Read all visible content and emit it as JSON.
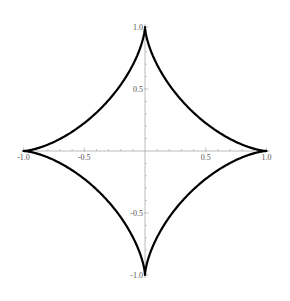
{
  "chart_data": {
    "type": "line",
    "title": "",
    "subtitle": "",
    "xlabel": "",
    "ylabel": "",
    "series": [
      {
        "name": "astroid",
        "color": "#000000",
        "equation": "x^(2/3) + y^(2/3) = 1"
      }
    ],
    "cusps": [
      [
        1.0,
        0.0
      ],
      [
        0.0,
        1.0
      ],
      [
        -1.0,
        0.0
      ],
      [
        0.0,
        -1.0
      ]
    ],
    "xlim": [
      -1.0,
      1.0
    ],
    "ylim": [
      -1.0,
      1.0
    ],
    "x_ticks": [
      -1.0,
      -0.5,
      0.5,
      1.0
    ],
    "y_ticks": [
      -1.0,
      -0.5,
      0.5,
      1.0
    ],
    "x_tick_labels": [
      "-1.0",
      "-0.5",
      "0.5",
      "1.0"
    ],
    "y_tick_labels": [
      "1.0",
      "0.5",
      "-0.5",
      "-1.0"
    ],
    "grid": false,
    "legend": null,
    "axes_origin": [
      0,
      0
    ]
  },
  "colors": {
    "curve": "#000000",
    "axis": "#aaaaaa",
    "tick_label": "#555555",
    "background": "#ffffff"
  }
}
